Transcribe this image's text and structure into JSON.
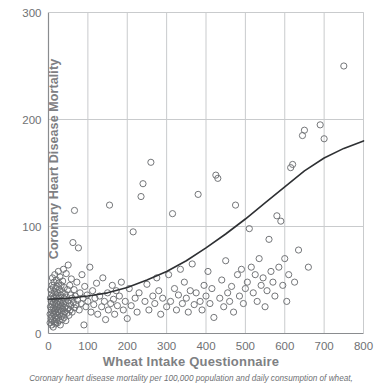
{
  "chart_data": {
    "type": "scatter",
    "title": "",
    "xlabel": "Wheat Intake Questionnaire",
    "ylabel": "Coronary Heart Disease Mortality",
    "caption": "Coronary heart disease mortality per 100,000 population and daily consumption of wheat,",
    "xlim": [
      0,
      800
    ],
    "ylim": [
      0,
      300
    ],
    "xticks": [
      0,
      100,
      200,
      300,
      400,
      500,
      600,
      700,
      800
    ],
    "yticks": [
      0,
      100,
      200,
      300
    ],
    "xtick_labels": [
      "0",
      "100",
      "200",
      "300",
      "400",
      "500",
      "600",
      "700",
      "800"
    ],
    "ytick_labels": [
      "0",
      "100",
      "200",
      "300"
    ],
    "grid": true,
    "grid_color": "#c9cbcd",
    "axis_color": "#8a8c8f",
    "marker": "open-circle",
    "marker_color": "#6d6f72",
    "marker_radius": 3.1,
    "legend": null,
    "points": [
      [
        4,
        10
      ],
      [
        4,
        18
      ],
      [
        5,
        25
      ],
      [
        5,
        33
      ],
      [
        6,
        14
      ],
      [
        6,
        41
      ],
      [
        7,
        22
      ],
      [
        7,
        30
      ],
      [
        8,
        8
      ],
      [
        8,
        37
      ],
      [
        9,
        16
      ],
      [
        9,
        45
      ],
      [
        10,
        12
      ],
      [
        10,
        27
      ],
      [
        10,
        52
      ],
      [
        11,
        20
      ],
      [
        11,
        35
      ],
      [
        12,
        6
      ],
      [
        12,
        29
      ],
      [
        12,
        43
      ],
      [
        13,
        18
      ],
      [
        13,
        24
      ],
      [
        14,
        33
      ],
      [
        14,
        48
      ],
      [
        15,
        11
      ],
      [
        15,
        21
      ],
      [
        15,
        39
      ],
      [
        16,
        27
      ],
      [
        16,
        55
      ],
      [
        17,
        15
      ],
      [
        17,
        31
      ],
      [
        18,
        9
      ],
      [
        18,
        23
      ],
      [
        18,
        42
      ],
      [
        19,
        19
      ],
      [
        19,
        36
      ],
      [
        20,
        13
      ],
      [
        20,
        28
      ],
      [
        20,
        50
      ],
      [
        21,
        17
      ],
      [
        21,
        34
      ],
      [
        22,
        25
      ],
      [
        22,
        44
      ],
      [
        23,
        10
      ],
      [
        23,
        30
      ],
      [
        24,
        20
      ],
      [
        24,
        38
      ],
      [
        25,
        15
      ],
      [
        25,
        27
      ],
      [
        25,
        58
      ],
      [
        26,
        22
      ],
      [
        26,
        47
      ],
      [
        27,
        12
      ],
      [
        27,
        33
      ],
      [
        28,
        18
      ],
      [
        28,
        41
      ],
      [
        29,
        25
      ],
      [
        29,
        53
      ],
      [
        30,
        8
      ],
      [
        30,
        29
      ],
      [
        31,
        36
      ],
      [
        32,
        16
      ],
      [
        32,
        45
      ],
      [
        33,
        21
      ],
      [
        33,
        31
      ],
      [
        34,
        26
      ],
      [
        35,
        13
      ],
      [
        35,
        39
      ],
      [
        36,
        23
      ],
      [
        36,
        49
      ],
      [
        37,
        18
      ],
      [
        38,
        28
      ],
      [
        38,
        60
      ],
      [
        39,
        33
      ],
      [
        40,
        15
      ],
      [
        40,
        43
      ],
      [
        41,
        24
      ],
      [
        42,
        20
      ],
      [
        42,
        37
      ],
      [
        43,
        30
      ],
      [
        44,
        12
      ],
      [
        45,
        26
      ],
      [
        45,
        56
      ],
      [
        46,
        34
      ],
      [
        47,
        19
      ],
      [
        48,
        41
      ],
      [
        49,
        23
      ],
      [
        50,
        31
      ],
      [
        50,
        64
      ],
      [
        52,
        17
      ],
      [
        53,
        28
      ],
      [
        54,
        45
      ],
      [
        55,
        22
      ],
      [
        56,
        36
      ],
      [
        57,
        26
      ],
      [
        58,
        51
      ],
      [
        60,
        20
      ],
      [
        60,
        33
      ],
      [
        62,
        85
      ],
      [
        63,
        29
      ],
      [
        65,
        41
      ],
      [
        66,
        24
      ],
      [
        66,
        115
      ],
      [
        68,
        35
      ],
      [
        70,
        27
      ],
      [
        72,
        48
      ],
      [
        74,
        31
      ],
      [
        76,
        80
      ],
      [
        78,
        22
      ],
      [
        80,
        38
      ],
      [
        83,
        28
      ],
      [
        85,
        55
      ],
      [
        88,
        33
      ],
      [
        90,
        8
      ],
      [
        92,
        44
      ],
      [
        95,
        25
      ],
      [
        98,
        36
      ],
      [
        100,
        30
      ],
      [
        105,
        62
      ],
      [
        108,
        20
      ],
      [
        112,
        40
      ],
      [
        115,
        27
      ],
      [
        118,
        33
      ],
      [
        122,
        47
      ],
      [
        125,
        18
      ],
      [
        130,
        35
      ],
      [
        135,
        25
      ],
      [
        138,
        52
      ],
      [
        142,
        30
      ],
      [
        145,
        13
      ],
      [
        150,
        38
      ],
      [
        152,
        22
      ],
      [
        155,
        120
      ],
      [
        158,
        28
      ],
      [
        162,
        45
      ],
      [
        165,
        32
      ],
      [
        168,
        18
      ],
      [
        172,
        40
      ],
      [
        175,
        26
      ],
      [
        180,
        35
      ],
      [
        185,
        48
      ],
      [
        190,
        22
      ],
      [
        195,
        30
      ],
      [
        200,
        14
      ],
      [
        205,
        42
      ],
      [
        210,
        26
      ],
      [
        215,
        95
      ],
      [
        220,
        33
      ],
      [
        225,
        20
      ],
      [
        230,
        38
      ],
      [
        235,
        128
      ],
      [
        240,
        140
      ],
      [
        245,
        30
      ],
      [
        250,
        46
      ],
      [
        255,
        22
      ],
      [
        260,
        160
      ],
      [
        265,
        35
      ],
      [
        270,
        28
      ],
      [
        275,
        52
      ],
      [
        280,
        40
      ],
      [
        285,
        18
      ],
      [
        290,
        33
      ],
      [
        300,
        25
      ],
      [
        305,
        55
      ],
      [
        310,
        30
      ],
      [
        315,
        112
      ],
      [
        320,
        42
      ],
      [
        325,
        22
      ],
      [
        330,
        36
      ],
      [
        335,
        60
      ],
      [
        340,
        28
      ],
      [
        345,
        48
      ],
      [
        350,
        33
      ],
      [
        355,
        20
      ],
      [
        360,
        40
      ],
      [
        365,
        65
      ],
      [
        370,
        27
      ],
      [
        375,
        38
      ],
      [
        380,
        130
      ],
      [
        385,
        30
      ],
      [
        390,
        22
      ],
      [
        395,
        45
      ],
      [
        400,
        35
      ],
      [
        405,
        58
      ],
      [
        410,
        28
      ],
      [
        415,
        42
      ],
      [
        420,
        15
      ],
      [
        425,
        148
      ],
      [
        430,
        145
      ],
      [
        435,
        33
      ],
      [
        440,
        50
      ],
      [
        445,
        25
      ],
      [
        450,
        68
      ],
      [
        455,
        38
      ],
      [
        460,
        30
      ],
      [
        465,
        44
      ],
      [
        470,
        20
      ],
      [
        475,
        120
      ],
      [
        480,
        55
      ],
      [
        485,
        35
      ],
      [
        490,
        60
      ],
      [
        495,
        28
      ],
      [
        500,
        42
      ],
      [
        505,
        48
      ],
      [
        510,
        98
      ],
      [
        515,
        62
      ],
      [
        520,
        38
      ],
      [
        525,
        55
      ],
      [
        530,
        30
      ],
      [
        535,
        70
      ],
      [
        540,
        45
      ],
      [
        545,
        52
      ],
      [
        550,
        25
      ],
      [
        555,
        40
      ],
      [
        560,
        88
      ],
      [
        565,
        58
      ],
      [
        570,
        48
      ],
      [
        575,
        35
      ],
      [
        580,
        110
      ],
      [
        585,
        62
      ],
      [
        590,
        105
      ],
      [
        595,
        45
      ],
      [
        600,
        70
      ],
      [
        605,
        30
      ],
      [
        610,
        55
      ],
      [
        615,
        155
      ],
      [
        620,
        158
      ],
      [
        625,
        48
      ],
      [
        635,
        78
      ],
      [
        645,
        185
      ],
      [
        650,
        190
      ],
      [
        660,
        62
      ],
      [
        690,
        195
      ],
      [
        700,
        182
      ],
      [
        750,
        250
      ]
    ],
    "fit_curve": {
      "label": "regression-curve",
      "color": "#2e3033",
      "points": [
        [
          0,
          32
        ],
        [
          50,
          33
        ],
        [
          100,
          35
        ],
        [
          150,
          38
        ],
        [
          200,
          43
        ],
        [
          250,
          50
        ],
        [
          300,
          58
        ],
        [
          350,
          68
        ],
        [
          400,
          80
        ],
        [
          450,
          93
        ],
        [
          500,
          107
        ],
        [
          550,
          122
        ],
        [
          600,
          137
        ],
        [
          650,
          152
        ],
        [
          700,
          164
        ],
        [
          750,
          173
        ],
        [
          800,
          180
        ]
      ]
    }
  }
}
